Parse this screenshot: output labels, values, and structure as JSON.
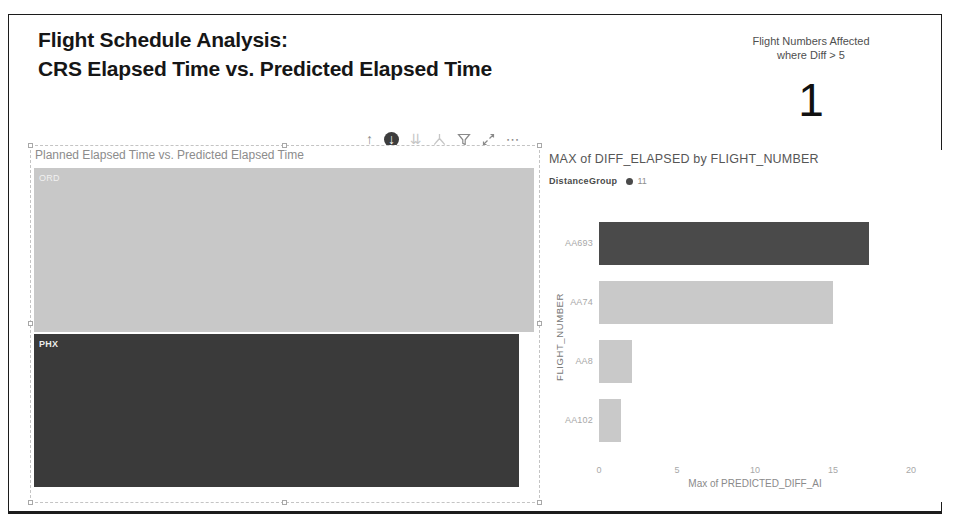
{
  "header": {
    "title_line1": "Flight Schedule Analysis:",
    "title_line2": "CRS Elapsed Time vs. Predicted Elapsed Time"
  },
  "kpi_card": {
    "label_line1": "Flight Numbers Affected",
    "label_line2": "where Diff > 5",
    "value": "1"
  },
  "visual_toolbar": {
    "icons": [
      {
        "name": "drill-up-icon",
        "tooltip": "Drill up"
      },
      {
        "name": "drill-down-icon",
        "tooltip": "Drill down"
      },
      {
        "name": "go-to-next-level-icon",
        "tooltip": "Go to the next level"
      },
      {
        "name": "expand-all-icon",
        "tooltip": "Expand all down one level"
      },
      {
        "name": "filter-icon",
        "tooltip": "Filters"
      },
      {
        "name": "focus-mode-icon",
        "tooltip": "Focus mode"
      },
      {
        "name": "more-options-icon",
        "tooltip": "More options"
      }
    ]
  },
  "left_visual": {
    "title": "Planned Elapsed Time vs. Predicted Elapsed Time",
    "blocks": [
      {
        "label": "ORD"
      },
      {
        "label": "PHX"
      }
    ]
  },
  "right_visual": {
    "title": "MAX of DIFF_ELAPSED by FLIGHT_NUMBER",
    "legend_title": "DistanceGroup",
    "legend_value": "11",
    "y_axis_title": "FLIGHT_NUMBER",
    "x_axis_title": "Max of PREDICTED_DIFF_AI"
  },
  "chart_data": [
    {
      "type": "bar",
      "orientation": "horizontal",
      "title": "MAX of DIFF_ELAPSED by FLIGHT_NUMBER",
      "categories": [
        "AA693",
        "AA74",
        "AA8",
        "AA102"
      ],
      "values": [
        17.3,
        15.0,
        2.1,
        1.4
      ],
      "bar_colors": [
        "#4a4a4a",
        "#c9c9c9",
        "#c9c9c9",
        "#c9c9c9"
      ],
      "xlabel": "Max of PREDICTED_DIFF_AI",
      "ylabel": "FLIGHT_NUMBER",
      "xlim": [
        0,
        20
      ],
      "xticks": [
        0,
        5,
        10,
        15,
        20
      ],
      "grid": false,
      "legend": {
        "position": "top",
        "title": "DistanceGroup",
        "entries": [
          {
            "label": "11",
            "color": "#4a4a4a"
          }
        ]
      }
    },
    {
      "type": "bar",
      "orientation": "horizontal",
      "title": "Planned Elapsed Time vs. Predicted Elapsed Time",
      "categories": [
        "ORD",
        "PHX"
      ],
      "values_relative_pct": [
        100,
        97
      ],
      "bar_colors": [
        "#c8c8c8",
        "#3a3a3a"
      ],
      "note": "no numeric axis visible; block widths estimated relative to plot width"
    }
  ],
  "colors": {
    "dark_bar": "#4a4a4a",
    "light_bar": "#c9c9c9",
    "ord_block": "#c8c8c8",
    "phx_block": "#3a3a3a",
    "axis_text": "#a8a8a8",
    "title_text": "#161616",
    "visual_title_text": "#565656"
  }
}
